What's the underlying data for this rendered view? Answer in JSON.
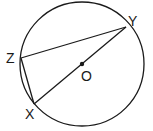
{
  "diagram": {
    "type": "circle-geometry",
    "circle": {
      "center": "O",
      "cx": 82,
      "cy": 64,
      "r": 62
    },
    "points": {
      "Z": {
        "label": "Z",
        "x": 21,
        "y": 58
      },
      "Y": {
        "label": "Y",
        "x": 126,
        "y": 27
      },
      "X": {
        "label": "X",
        "x": 34,
        "y": 104
      },
      "O": {
        "label": "O",
        "x": 82,
        "y": 64
      }
    },
    "segments": [
      "ZY",
      "ZX",
      "XY"
    ],
    "stroke_color": "#1a1a1a"
  }
}
